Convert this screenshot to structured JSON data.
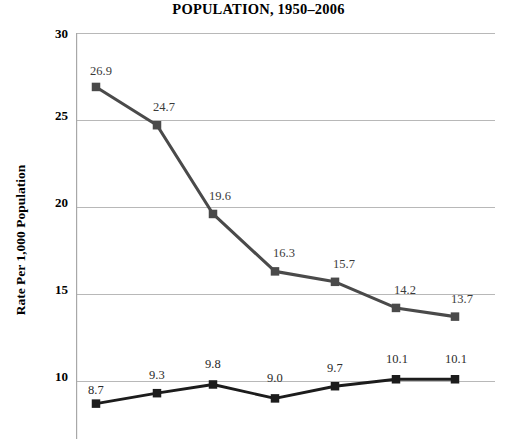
{
  "chart_data": {
    "type": "line",
    "title": "POPULATION, 1950–2006",
    "xlabel": "",
    "ylabel": "Rate Per 1,000 Population",
    "ylim": [
      5,
      30
    ],
    "yticks": [
      "30",
      "25",
      "20",
      "15",
      "10"
    ],
    "grid": true,
    "legend": "none",
    "x": [
      1950,
      1960,
      1970,
      1980,
      1990,
      2000,
      2006
    ],
    "categories": [
      "1950",
      "1960",
      "1970",
      "1980",
      "1990",
      "2000",
      "2006"
    ],
    "series": [
      {
        "name": "Birth Rate",
        "color": "#4a4a4a",
        "marker": "square",
        "values": [
          26.9,
          24.7,
          19.6,
          16.3,
          15.7,
          14.2,
          13.7
        ],
        "labels": [
          "26.9",
          "24.7",
          "19.6",
          "16.3",
          "15.7",
          "14.2",
          "13.7"
        ]
      },
      {
        "name": "Death Rate",
        "color": "#1c1c1c",
        "marker": "square",
        "values": [
          8.7,
          9.3,
          9.8,
          9.0,
          9.7,
          10.1,
          10.1
        ],
        "labels": [
          "8.7",
          "9.3",
          "9.8",
          "9.0",
          "9.7",
          "10.1",
          "10.1"
        ]
      }
    ]
  },
  "axis": {
    "tick_30": "30",
    "tick_25": "25",
    "tick_20": "20",
    "tick_15": "15",
    "tick_10": "10"
  },
  "colors": {
    "background": "#ffffff",
    "gridline": "#b8b8b8",
    "axis_line": "#a8a8a8",
    "upper_series": "#4a4a4a",
    "lower_series": "#1c1c1c",
    "text": "#000000",
    "data_label": "#3a3a3a"
  }
}
